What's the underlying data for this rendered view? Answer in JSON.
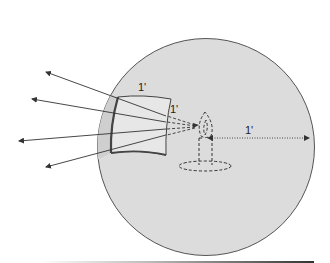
{
  "diagram": {
    "type": "illustration",
    "labels": {
      "patch_width": "1'",
      "patch_height": "1'",
      "radius": "1'"
    },
    "colors": {
      "sphere_fill": "#dcdcdc",
      "sphere_edge": "#555555",
      "patch_fill": "#e6e6e6",
      "band_fill": "#cfcfcf",
      "line": "#333333",
      "background": "#ffffff"
    },
    "rays": [
      {
        "from": [
          166,
          116
        ],
        "to": [
          45,
          72
        ]
      },
      {
        "from": [
          166,
          122
        ],
        "to": [
          31,
          99
        ]
      },
      {
        "from": [
          166,
          129
        ],
        "to": [
          18,
          141
        ]
      },
      {
        "from": [
          166,
          135
        ],
        "to": [
          45,
          167
        ]
      }
    ]
  }
}
